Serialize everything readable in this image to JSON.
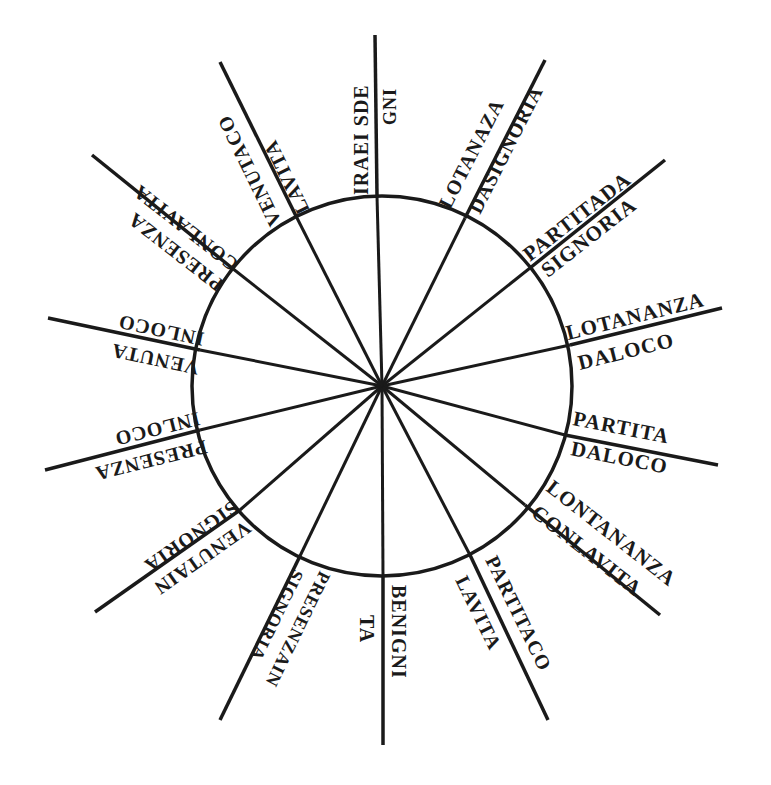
{
  "diagram": {
    "type": "radial-wheel",
    "center": [
      382,
      386
    ],
    "radius": 190,
    "ink_color": "#1a1a1a",
    "background": "#ffffff",
    "spokes": [
      {
        "id": "top",
        "angle": -90,
        "outer": "IRAEI SDE",
        "inner": "GNI"
      },
      {
        "id": "n-ne",
        "angle": -67.5,
        "outer": "LOTANAZA",
        "inner": "DASIGNORIA"
      },
      {
        "id": "ne",
        "angle": -45,
        "outer": "PARTITADA",
        "inner": "SIGNORIA"
      },
      {
        "id": "e-ne",
        "angle": -22.5,
        "outer": "LOTANANZA",
        "inner": "DALOCO"
      },
      {
        "id": "e",
        "angle": 0,
        "outer": "PARTITA",
        "inner": "DALOCO"
      },
      {
        "id": "e-se",
        "angle": 22.5,
        "outer": "LONTANANZA",
        "inner": "CONLAVITA"
      },
      {
        "id": "se",
        "angle": 45,
        "outer": "PARTITACO",
        "inner": "LAVITA"
      },
      {
        "id": "s-se",
        "angle": 67.5,
        "outer": "BENIGNI",
        "inner": "TA"
      },
      {
        "id": "s",
        "angle": 90,
        "outer": "PRESENZAIN",
        "inner": "SIGNORIA"
      },
      {
        "id": "s-sw",
        "angle": 112.5,
        "outer": "VENUTAIN",
        "inner": "SIGNORIA"
      },
      {
        "id": "sw",
        "angle": 135,
        "outer": "PRESENZA",
        "inner": "INLOCO"
      },
      {
        "id": "w-sw",
        "angle": 157.5,
        "outer": "VENUTA",
        "inner": "INLOCO"
      },
      {
        "id": "w",
        "angle": 180,
        "outer": "PRESENZA",
        "inner": "CONLAVITA"
      },
      {
        "id": "w-nw",
        "angle": 202.5,
        "outer": "VENUTACO",
        "inner": "LAVITA"
      }
    ],
    "labels": {
      "top_outer": "IRAEI SDE",
      "top_inner": "GNI",
      "nne_outer": "LOTANAZA",
      "nne_inner": "DASIGNORIA",
      "ne_outer": "PARTITADA",
      "ne_inner": "SIGNORIA",
      "ene_outer": "LOTANANZA",
      "ene_inner": "DALOCO",
      "e_outer": "PARTITA",
      "e_inner": "DALOCO",
      "ese_outer": "LONTANANZA",
      "ese_inner": "CONLAVITA",
      "se_outer": "PARTITACO",
      "se_inner": "LAVITA",
      "sse_outer": "BENIGNI",
      "sse_inner": "TA",
      "ssw_outer": "PRESENZAIN",
      "ssw_inner": "SIGNORIA",
      "sw_outer": "VENUTAIN",
      "sw_inner": "SIGNORIA",
      "wsw_outer": "PRESENZA",
      "wsw_inner": "INLOCO",
      "w_outer": "VENUTA",
      "w_inner": "INLOCO",
      "wnw_outer": "PRESENZA",
      "wnw_inner": "CONLAVITA",
      "nw_outer": "VENUTACO",
      "nw_inner": "LAVITA"
    }
  }
}
